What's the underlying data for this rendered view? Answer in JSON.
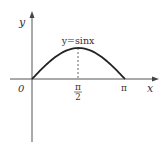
{
  "chart_data": {
    "type": "line",
    "title": "",
    "function_label": "y=sinx",
    "xlabel": "x",
    "ylabel": "y",
    "origin_label": "0",
    "x_ticks": [
      {
        "value": 1.5708,
        "label_num": "π",
        "label_den": "2"
      },
      {
        "value": 3.1416,
        "label": "π"
      }
    ],
    "series": [
      {
        "name": "y=sinx",
        "x": [
          0,
          0.3927,
          0.7854,
          1.1781,
          1.5708,
          1.9635,
          2.3562,
          2.7489,
          3.1416
        ],
        "values": [
          0,
          0.3827,
          0.7071,
          0.9239,
          1.0,
          0.9239,
          0.7071,
          0.3827,
          0
        ]
      }
    ],
    "annotations": [
      {
        "type": "dashed-vertical",
        "x": 1.5708,
        "from_y": 0,
        "to_y": 1
      }
    ],
    "xlim": [
      -0.7,
      4.0
    ],
    "ylim": [
      -2.0,
      2.1
    ],
    "grid": false,
    "legend": "none"
  },
  "colors": {
    "curve": "#222222",
    "axis": "#444444",
    "text": "#333333"
  }
}
